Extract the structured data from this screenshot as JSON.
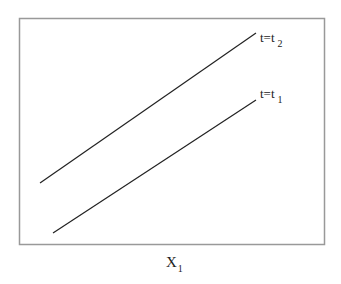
{
  "diagram": {
    "frame": {
      "x": 19,
      "y": 18,
      "width": 305,
      "height": 226,
      "stroke": "#999999"
    },
    "lines": [
      {
        "name": "t2",
        "x1": 40,
        "y1": 183,
        "x2": 256,
        "y2": 33,
        "label_base": "t=t",
        "label_sub": "2",
        "label_x": 260,
        "label_y": 42
      },
      {
        "name": "t1",
        "x1": 53,
        "y1": 233,
        "x2": 256,
        "y2": 100,
        "label_base": "t=t",
        "label_sub": "1",
        "label_x": 260,
        "label_y": 98
      }
    ],
    "x_axis_label": {
      "base": "X",
      "sub": "1"
    },
    "line_color": "#222222"
  }
}
